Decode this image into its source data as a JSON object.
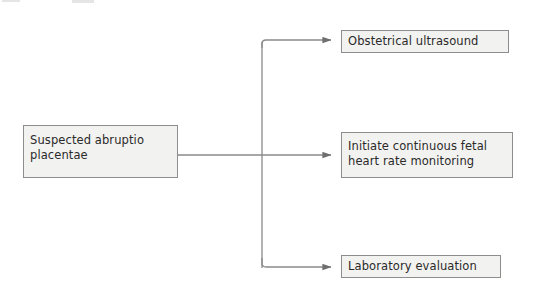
{
  "diagram": {
    "type": "flowchart",
    "orientation": "left-to-right",
    "background_color": "#ffffff",
    "node_fill_color": "#f2f2f0",
    "node_border_color": "#8d8d8d",
    "edge_color": "#8a8a8a",
    "text_color": "#2a2a2a",
    "nodes": [
      {
        "id": "source",
        "label": "Suspected abruptio\nplacentae",
        "role": "clinical-scenario"
      },
      {
        "id": "ultrasound",
        "label": "Obstetrical ultrasound",
        "role": "action"
      },
      {
        "id": "monitoring",
        "label": "Initiate continuous fetal\nheart rate monitoring",
        "role": "action"
      },
      {
        "id": "lab",
        "label": "Laboratory evaluation",
        "role": "action"
      }
    ],
    "edges": [
      {
        "from": "source",
        "to": "ultrasound",
        "arrow": "filled-triangle"
      },
      {
        "from": "source",
        "to": "monitoring",
        "arrow": "filled-triangle"
      },
      {
        "from": "source",
        "to": "lab",
        "arrow": "filled-triangle"
      }
    ]
  }
}
